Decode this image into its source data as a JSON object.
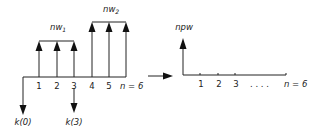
{
  "diagram": {
    "left": {
      "axis_tick_labels": [
        "1",
        "2",
        "3",
        "4",
        "5"
      ],
      "end_label": "n = 6",
      "group1_label": "nw",
      "group1_sub": "1",
      "group2_label": "nw",
      "group2_sub": "2",
      "down_labels": [
        "k(0)",
        "k(3)"
      ]
    },
    "transform_arrow": "right-arrow",
    "right": {
      "y_label": "npw",
      "axis_tick_labels": [
        "1",
        "2",
        "3"
      ],
      "ellipsis": ". . . .",
      "end_label": "n = 6"
    }
  }
}
